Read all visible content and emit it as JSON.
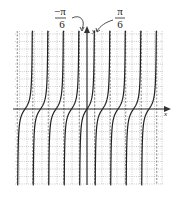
{
  "chart_data": {
    "type": "line",
    "title": "",
    "function": "y = tan(3x)",
    "xlabel": "x",
    "ylabel": "y",
    "period": "π/3",
    "annotations": [
      {
        "text_num": "−π",
        "text_den": "6",
        "points_to": "asymptote x = −π/6"
      },
      {
        "text_num": "π",
        "text_den": "6",
        "points_to": "asymptote x = π/6"
      }
    ],
    "asymptotes_dashed": true,
    "grid": true,
    "branches_left_of_origin": 5,
    "branches_right_of_origin": 4
  },
  "labels": {
    "neg_num": "−π",
    "neg_den": "6",
    "pos_num": "π",
    "pos_den": "6",
    "x_axis": "x",
    "y_axis": "y"
  },
  "layout": {
    "origin_x": 87,
    "origin_y": 109,
    "grid_left": 15,
    "grid_right": 163,
    "grid_top": 31,
    "grid_bottom": 185,
    "grid_step": 7.5,
    "period_px": 15.5
  },
  "colors": {
    "curve": "#222222",
    "grid": "#9a9a9a",
    "axis": "#333333"
  }
}
